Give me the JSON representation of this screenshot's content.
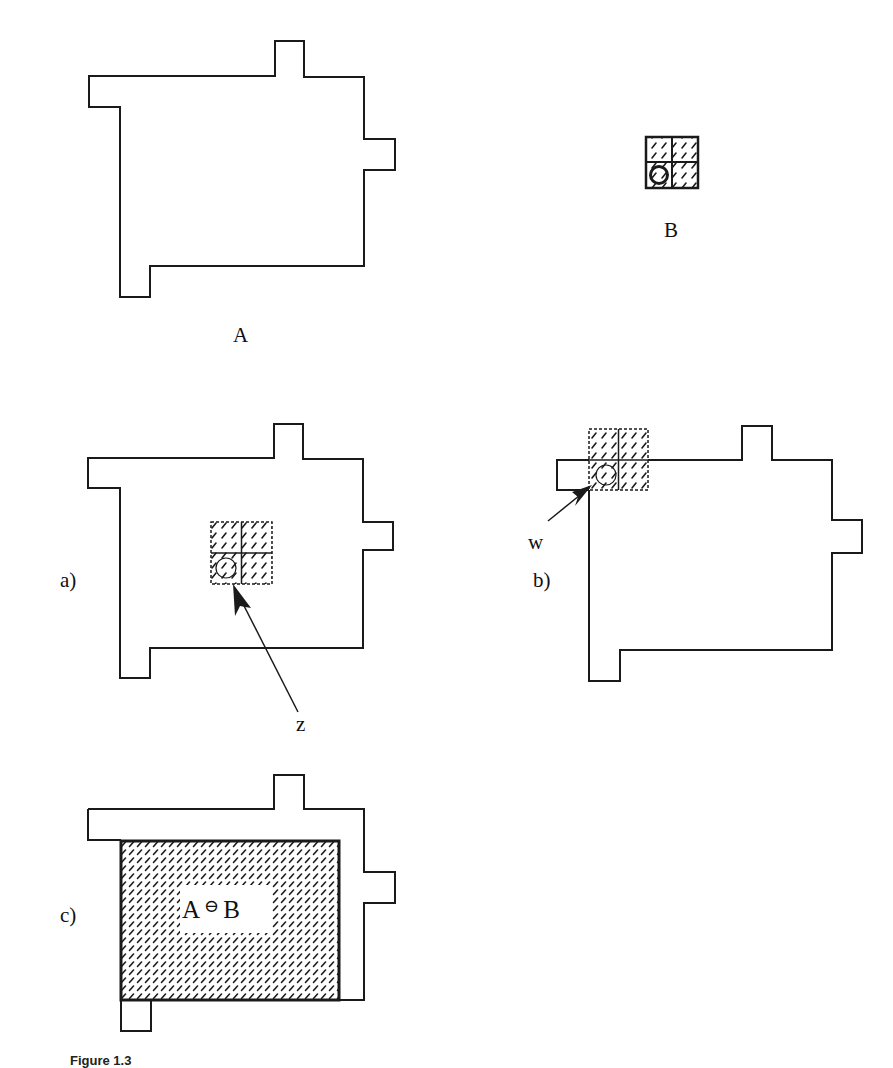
{
  "figure": {
    "labels": {
      "set_a": "A",
      "set_b": "B",
      "panel_a": "a)",
      "panel_b": "b)",
      "panel_c": "c)",
      "point_z": "z",
      "point_w": "w"
    },
    "result_expression": {
      "left": "A",
      "operator": "⊖",
      "right": "B"
    },
    "caption": "Figure 1.3"
  },
  "colors": {
    "stroke": "#1a1a1a",
    "hatch": "#1a1a1a",
    "background": "#ffffff"
  }
}
